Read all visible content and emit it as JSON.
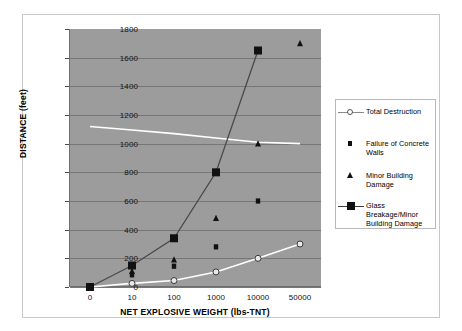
{
  "chart_data": {
    "type": "line",
    "title": "",
    "xlabel": "NET EXPLOSIVE WEIGHT (lbs-TNT)",
    "ylabel": "DISTANCE (feet)",
    "categories": [
      "0",
      "10",
      "100",
      "1000",
      "10000",
      "50000"
    ],
    "ylim": [
      0,
      1800
    ],
    "yticks": [
      "0",
      "200",
      "400",
      "600",
      "800",
      "1000",
      "1200",
      "1400",
      "1600",
      "1800"
    ],
    "ytick_step": 200,
    "grid": "horizontal",
    "legend_position": "right",
    "plot_background": "#9c9c9c",
    "series": [
      {
        "name": "Total Destruction",
        "marker": "open-circle",
        "line": true,
        "color": "#ffffff",
        "values": [
          0,
          25,
          45,
          105,
          200,
          300
        ]
      },
      {
        "name": "Failure of Concrete Walls",
        "marker": "small-filled-square",
        "line": false,
        "color": "#111111",
        "values": [
          null,
          85,
          145,
          280,
          600,
          null
        ]
      },
      {
        "name": "Minor Building Damage",
        "marker": "filled-triangle",
        "line": true,
        "color": "#ffffff",
        "values": [
          1120,
          110,
          190,
          480,
          1000,
          1700
        ],
        "line_values": [
          1120,
          1095,
          1070,
          1040,
          1010,
          1000
        ]
      },
      {
        "name": "Glass Breakage/Minor Building Damage",
        "marker": "large-filled-square",
        "line": true,
        "color": "#4a4a4a",
        "values": [
          0,
          150,
          340,
          800,
          1650,
          null
        ]
      }
    ]
  },
  "legend": {
    "items": [
      {
        "label": "Total Destruction",
        "key": "open-circle-line"
      },
      {
        "label": "Failure of Concrete Walls",
        "key": "small-filled-square"
      },
      {
        "label": "Minor Building Damage",
        "key": "filled-triangle"
      },
      {
        "label": "Glass Breakage/Minor Building Damage",
        "key": "large-filled-square-line"
      }
    ]
  }
}
